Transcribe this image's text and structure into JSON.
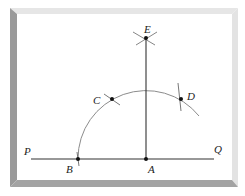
{
  "figure": {
    "type": "geometric-construction",
    "colors": {
      "frame_left": "#9a9a9a",
      "frame_top": "#e6e6e6",
      "frame_right": "#e3e3e3",
      "frame_bottom": "#a3a3a3",
      "canvas": "#ffffff",
      "line": "#333333",
      "arc": "#8c8c8c",
      "point": "#111111"
    },
    "labels": {
      "P": "P",
      "Q": "Q",
      "A": "A",
      "B": "B",
      "C": "C",
      "D": "D",
      "E": "E"
    },
    "points": {
      "A": [
        146,
        159
      ],
      "B": [
        78,
        159
      ],
      "C": [
        112,
        99
      ],
      "D": [
        181,
        99
      ],
      "E": [
        146,
        38
      ]
    },
    "segments": [
      {
        "name": "PQ",
        "from": [
          31,
          159
        ],
        "to": [
          214,
          159
        ]
      },
      {
        "name": "AE",
        "from": [
          146,
          159
        ],
        "to": [
          146,
          38
        ]
      }
    ],
    "arc": {
      "center": "A",
      "radius": 68,
      "from": "B",
      "through": [
        "C",
        "D"
      ]
    }
  }
}
